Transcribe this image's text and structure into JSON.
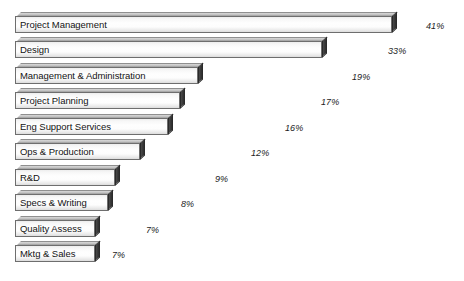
{
  "chart_data": {
    "type": "bar",
    "orientation": "horizontal",
    "title": "",
    "subtitle": "",
    "xlabel": "",
    "ylabel": "",
    "grid": false,
    "legend": false,
    "axis_visible": false,
    "value_suffix": "%",
    "xlim": [
      0,
      45
    ],
    "categories": [
      "Project Management",
      "Design",
      "Management & Administration",
      "Project Planning",
      "Eng Support Services",
      "Ops & Production",
      "R&D",
      "Specs & Writing",
      "Quality Assess",
      "Mktg & Sales"
    ],
    "values": [
      41,
      33,
      19,
      17,
      16,
      12,
      9,
      8,
      7,
      7
    ],
    "value_labels": [
      "41%",
      "33%",
      "19%",
      "17%",
      "16%",
      "12%",
      "9%",
      "8%",
      "7%",
      "7%"
    ],
    "colors": {
      "background": "#ffffff",
      "bar_face_light": "#fefefe",
      "bar_face_shade": "#dcdcdc",
      "bar_outline": "#6e6e6e",
      "bar_side": "#3a3a3a",
      "bar_top": "#c2c2c2",
      "label_text": "#131313",
      "value_text": "#1d1d1d"
    }
  },
  "rows": [
    {
      "label": "Project Management",
      "value": 41,
      "value_label": "41%",
      "bar_px": 377,
      "row_top": 12,
      "value_x": 426
    },
    {
      "label": "Design",
      "value": 33,
      "value_label": "33%",
      "bar_px": 307,
      "row_top": 37,
      "value_x": 388
    },
    {
      "label": "Management & Administration",
      "value": 19,
      "value_label": "19%",
      "bar_px": 183,
      "row_top": 63,
      "value_x": 352
    },
    {
      "label": "Project Planning",
      "value": 17,
      "value_label": "17%",
      "bar_px": 165,
      "row_top": 88,
      "value_x": 321
    },
    {
      "label": "Eng Support Services",
      "value": 16,
      "value_label": "16%",
      "bar_px": 153,
      "row_top": 114,
      "value_x": 285
    },
    {
      "label": "Ops & Production",
      "value": 12,
      "value_label": "12%",
      "bar_px": 125,
      "row_top": 139,
      "value_x": 251
    },
    {
      "label": "R&D",
      "value": 9,
      "value_label": "9%",
      "bar_px": 100,
      "row_top": 165,
      "value_x": 215
    },
    {
      "label": "Specs & Writing",
      "value": 8,
      "value_label": "8%",
      "bar_px": 93,
      "row_top": 190,
      "value_x": 181
    },
    {
      "label": "Quality Assess",
      "value": 7,
      "value_label": "7%",
      "bar_px": 80,
      "row_top": 216,
      "value_x": 146
    },
    {
      "label": "Mktg & Sales",
      "value": 7,
      "value_label": "7%",
      "bar_px": 80,
      "row_top": 241,
      "value_x": 112
    }
  ]
}
